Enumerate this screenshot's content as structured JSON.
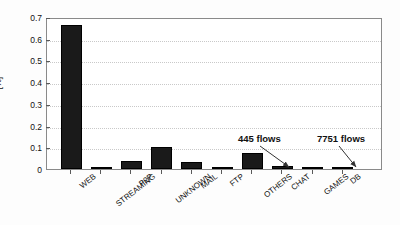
{
  "chart_data": {
    "type": "bar",
    "title": "",
    "xlabel": "",
    "ylabel": "[%]",
    "ylim": [
      0,
      0.7
    ],
    "yticks": [
      "0",
      "0.1",
      "0.2",
      "0.3",
      "0.4",
      "0.5",
      "0.6",
      "0.7"
    ],
    "ytick_values": [
      0,
      0.1,
      0.2,
      0.3,
      0.4,
      0.5,
      0.6,
      0.7
    ],
    "grid": true,
    "legend": "none",
    "categories": [
      "WEB",
      "STREAMING",
      "P2P",
      "UNKNOWN",
      "MAIL",
      "FTP",
      "OTHERS",
      "CHAT",
      "GAMES",
      "DB"
    ],
    "values": [
      0.665,
      0.008,
      0.035,
      0.1,
      0.033,
      0.004,
      0.075,
      0.014,
      0.002,
      0.001
    ],
    "bar_color": "#1a1a1a",
    "annotations": [
      {
        "text": "445 flows",
        "target_category": "GAMES"
      },
      {
        "text": "7751 flows",
        "target_category": "DB"
      }
    ]
  }
}
